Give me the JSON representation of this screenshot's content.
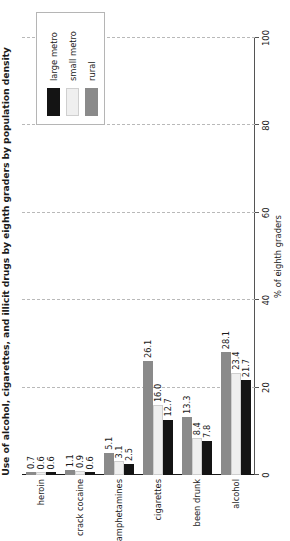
{
  "chart_data": {
    "type": "bar",
    "orientation": "horizontal",
    "title": "Use of alcohol, cigarettes, and illicit drugs by eighth graders by population density",
    "xlabel": "% of eighth graders",
    "ylabel": "",
    "categories": [
      "alcohol",
      "been drunk",
      "cigarettes",
      "amphetamines",
      "crack cocaine",
      "heroin"
    ],
    "series": [
      {
        "name": "large metro",
        "color": "#141414",
        "values": [
          21.7,
          7.8,
          12.7,
          2.5,
          0.6,
          0.6
        ]
      },
      {
        "name": "small metro",
        "color": "#efefef",
        "values": [
          23.4,
          8.4,
          16.0,
          3.1,
          0.9,
          0.6
        ]
      },
      {
        "name": "rural",
        "color": "#8a8a8a",
        "values": [
          28.1,
          13.3,
          26.1,
          5.1,
          1.1,
          0.7
        ]
      }
    ],
    "value_labels": {
      "alcohol": [
        "21.7",
        "23.4",
        "28.1"
      ],
      "been drunk": [
        "7.8",
        "8.4",
        "13.3"
      ],
      "cigarettes": [
        "12.7",
        "16.0",
        "26.1"
      ],
      "amphetamines": [
        "2.5",
        "3.1",
        "5.1"
      ],
      "crack cocaine": [
        "0.6",
        "0.9",
        "1.1"
      ],
      "heroin": [
        "0.6",
        "0.6",
        "0.7"
      ]
    },
    "xlim": [
      0,
      100
    ],
    "ticks": [
      "0",
      "20",
      "40",
      "60",
      "80",
      "100"
    ],
    "grid": true,
    "legend_position": "top-left"
  },
  "legend": {
    "items": [
      {
        "label": "large metro"
      },
      {
        "label": "small metro"
      },
      {
        "label": "rural"
      }
    ]
  }
}
